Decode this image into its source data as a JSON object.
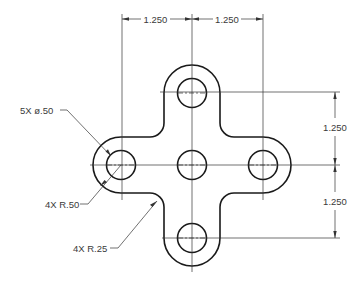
{
  "drawing": {
    "type": "engineering-part-drawing",
    "part_shape": "plus-shaped plate with rounded arm ends",
    "dimensions": {
      "horizontal_left": "1.250",
      "horizontal_right": "1.250",
      "vertical_top": "1.250",
      "vertical_bottom": "1.250"
    },
    "callouts": {
      "holes": "5X ø.50",
      "outer_radius": "4X R.50",
      "fillet_radius": "4X R.25"
    },
    "holes": [
      {
        "name": "top",
        "cx": 192,
        "cy": 93
      },
      {
        "name": "left",
        "cx": 121,
        "cy": 165
      },
      {
        "name": "center",
        "cx": 192,
        "cy": 165
      },
      {
        "name": "right",
        "cx": 263,
        "cy": 165
      },
      {
        "name": "bottom",
        "cx": 192,
        "cy": 238
      }
    ],
    "colors": {
      "line": "#1a1a1a",
      "background": "#ffffff"
    }
  }
}
